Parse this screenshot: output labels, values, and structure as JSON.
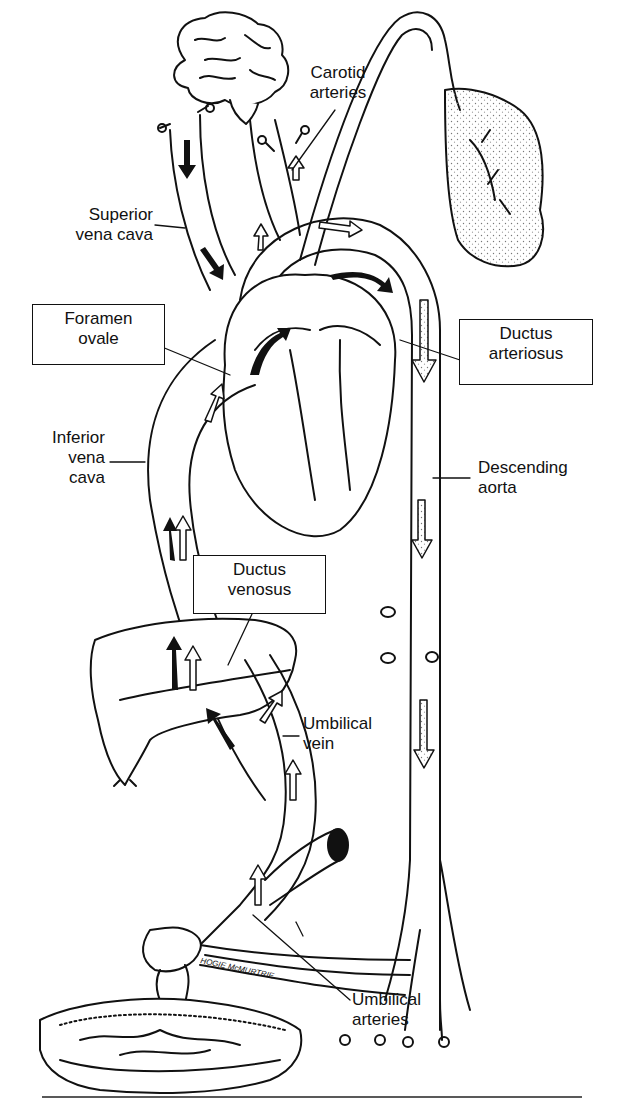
{
  "diagram": {
    "signature": "HOGIE McMURTRIE",
    "labels": {
      "carotid_arteries": {
        "line1": "Carotid",
        "line2": "arteries"
      },
      "superior_vena_cava": {
        "line1": "Superior",
        "line2": "vena cava"
      },
      "foramen_ovale": {
        "line1": "Foramen",
        "line2": "ovale"
      },
      "ductus_arteriosus": {
        "line1": "Ductus",
        "line2": "arteriosus"
      },
      "inferior_vena_cava": {
        "line1": "Inferior",
        "line2": "vena",
        "line3": "cava"
      },
      "descending_aorta": {
        "line1": "Descending",
        "line2": "aorta"
      },
      "ductus_venosus": {
        "line1": "Ductus",
        "line2": "venosus"
      },
      "umbilical_vein": {
        "line1": "Umbilical",
        "line2": "vein"
      },
      "umbilical_arteries": {
        "line1": "Umbilical",
        "line2": "arteries"
      }
    },
    "structures": [
      "brain",
      "lungs",
      "heart",
      "liver",
      "placenta",
      "umbilical cord",
      "descending aorta",
      "inferior vena cava",
      "superior vena cava"
    ],
    "colors": {
      "ink": "#111111",
      "background": "#ffffff",
      "stipple": "#888888"
    }
  }
}
